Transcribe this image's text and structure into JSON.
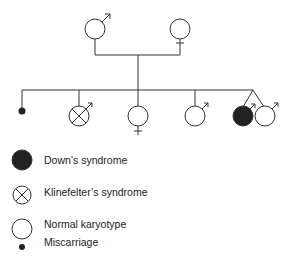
{
  "diagram": {
    "type": "pedigree",
    "colors": {
      "line": "#333333",
      "fill_affected": "#222222",
      "background": "#ffffff"
    },
    "parents": [
      {
        "id": "father",
        "sex": "male",
        "status": "normal"
      },
      {
        "id": "mother",
        "sex": "female",
        "status": "normal"
      }
    ],
    "children": [
      {
        "id": "child-1",
        "sex": "unknown",
        "status": "miscarriage"
      },
      {
        "id": "child-2",
        "sex": "male",
        "status": "klinefelter"
      },
      {
        "id": "child-3",
        "sex": "female",
        "status": "normal"
      },
      {
        "id": "child-4",
        "sex": "male",
        "status": "normal"
      },
      {
        "id": "child-5",
        "sex": "male",
        "status": "down",
        "twin": true
      },
      {
        "id": "child-6",
        "sex": "male",
        "status": "normal",
        "twin": true
      }
    ]
  },
  "legend": {
    "items": [
      {
        "symbol": "filled-circle",
        "label": "Down’s syndrome"
      },
      {
        "symbol": "crossed-circle",
        "label": "Klinefelter’s syndrome"
      },
      {
        "symbol": "open-circle",
        "label": "Normal karyotype"
      },
      {
        "symbol": "small-dot",
        "label": "Miscarriage"
      }
    ]
  }
}
